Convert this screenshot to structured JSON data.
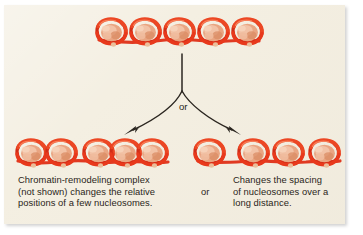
{
  "figure": {
    "panel_background_color": "#f4efe2",
    "text_color": "#2a2520",
    "dna_color": "#e03a22",
    "dna_highlight_color": "#f4704f",
    "histone_color": "#e8a98a",
    "histone_shadow_color": "#cf7f5e",
    "arrow_color": "#2b2620"
  },
  "diagram": {
    "branch_label": "or",
    "top_array": {
      "name": "starting-nucleosome-array",
      "nucleosome_count": 5,
      "spacing": "regular-close",
      "x_positions": [
        112,
        146,
        180,
        214,
        248
      ],
      "y": 32
    },
    "left_array": {
      "name": "repositioned-nucleosome-array",
      "nucleosome_count": 5,
      "spacing": "irregular",
      "x_positions": [
        32,
        62,
        99,
        126,
        153
      ],
      "y": 153
    },
    "right_array": {
      "name": "respaced-nucleosome-array",
      "nucleosome_count": 4,
      "spacing": "wide-even",
      "x_positions": [
        210,
        254,
        289,
        325
      ],
      "y": 153
    },
    "arrows": [
      {
        "name": "arrow-to-left-outcome",
        "from": [
          182,
          55
        ],
        "to": [
          126,
          134
        ]
      },
      {
        "name": "arrow-to-right-outcome",
        "from": [
          182,
          55
        ],
        "to": [
          240,
          134
        ]
      }
    ]
  },
  "captions": {
    "left": "Chromatin-remodeling complex\n(not shown) changes the relative\npositions of a few nucleosomes.",
    "separator": "or",
    "right": "Changes the spacing\nof nucleosomes over a\nlong distance."
  }
}
